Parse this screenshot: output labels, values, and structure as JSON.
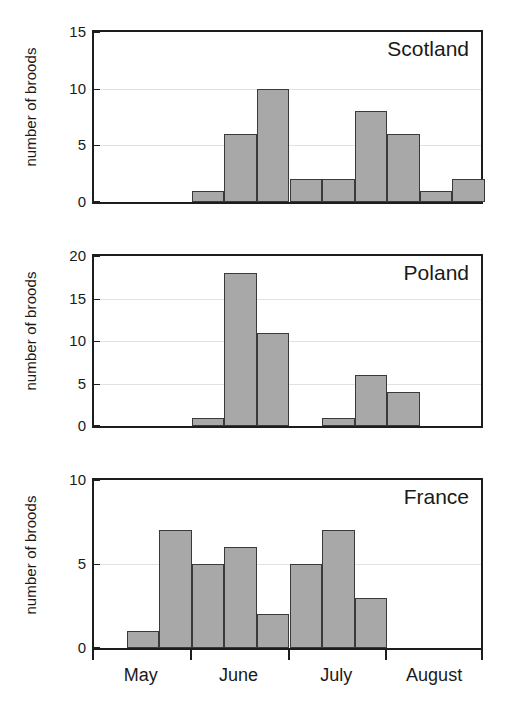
{
  "chart_data": {
    "type": "bar",
    "title": "",
    "subtitle": "",
    "xlabel": "",
    "ylabel": "number of broods",
    "grid": true,
    "legend": false,
    "x_tick_labels": [
      "May",
      "June",
      "July",
      "August"
    ],
    "x_axis_note": "Monthly blocks; each panel divided into 12 equal half-month bar slots spanning May through August",
    "panels": [
      {
        "name": "scotland",
        "annotation": "Scotland",
        "ylabel": "number of broods",
        "ylim": [
          0,
          15
        ],
        "yticks": [
          0,
          5,
          10,
          15
        ],
        "ytick_labels": [
          "0",
          "5",
          "10",
          "15"
        ],
        "n_slots": 12,
        "bars": [
          {
            "slot": 0,
            "value": 0
          },
          {
            "slot": 1,
            "value": 0
          },
          {
            "slot": 2,
            "value": 0
          },
          {
            "slot": 3,
            "value": 1
          },
          {
            "slot": 4,
            "value": 6
          },
          {
            "slot": 5,
            "value": 10
          },
          {
            "slot": 6,
            "value": 2
          },
          {
            "slot": 7,
            "value": 2
          },
          {
            "slot": 8,
            "value": 8
          },
          {
            "slot": 9,
            "value": 6
          },
          {
            "slot": 10,
            "value": 1
          },
          {
            "slot": 11,
            "value": 2
          }
        ],
        "values": [
          0,
          0,
          0,
          1,
          6,
          10,
          2,
          2,
          8,
          6,
          1,
          2
        ]
      },
      {
        "name": "poland",
        "annotation": "Poland",
        "ylabel": "number of broods",
        "ylim": [
          0,
          20
        ],
        "yticks": [
          0,
          5,
          10,
          15,
          20
        ],
        "ytick_labels": [
          "0",
          "5",
          "10",
          "15",
          "20"
        ],
        "n_slots": 12,
        "bars": [
          {
            "slot": 0,
            "value": 0
          },
          {
            "slot": 1,
            "value": 0
          },
          {
            "slot": 2,
            "value": 0
          },
          {
            "slot": 3,
            "value": 1
          },
          {
            "slot": 4,
            "value": 18
          },
          {
            "slot": 5,
            "value": 11
          },
          {
            "slot": 6,
            "value": 0
          },
          {
            "slot": 7,
            "value": 1
          },
          {
            "slot": 8,
            "value": 6
          },
          {
            "slot": 9,
            "value": 4
          },
          {
            "slot": 10,
            "value": 0
          },
          {
            "slot": 11,
            "value": 0
          }
        ],
        "values": [
          0,
          0,
          0,
          1,
          18,
          11,
          0,
          1,
          6,
          4,
          0,
          0
        ]
      },
      {
        "name": "france",
        "annotation": "France",
        "ylabel": "number of broods",
        "ylim": [
          0,
          10
        ],
        "yticks": [
          0,
          5,
          10
        ],
        "ytick_labels": [
          "0",
          "5",
          "10"
        ],
        "n_slots": 12,
        "bars": [
          {
            "slot": 0,
            "value": 0
          },
          {
            "slot": 1,
            "value": 1
          },
          {
            "slot": 2,
            "value": 7
          },
          {
            "slot": 3,
            "value": 5
          },
          {
            "slot": 4,
            "value": 6
          },
          {
            "slot": 5,
            "value": 2
          },
          {
            "slot": 6,
            "value": 5
          },
          {
            "slot": 7,
            "value": 7
          },
          {
            "slot": 8,
            "value": 3
          },
          {
            "slot": 9,
            "value": 0
          },
          {
            "slot": 10,
            "value": 0
          },
          {
            "slot": 11,
            "value": 0
          }
        ],
        "values": [
          0,
          1,
          7,
          5,
          6,
          2,
          5,
          7,
          3,
          0,
          0,
          0
        ]
      }
    ],
    "colors": {
      "bar_fill": "#a8a8a8",
      "bar_stroke": "#3a3a3a",
      "axis": "#1d1d1d",
      "grid": "#e2e2e2",
      "text": "#1a1a1a",
      "background": "#ffffff"
    }
  }
}
